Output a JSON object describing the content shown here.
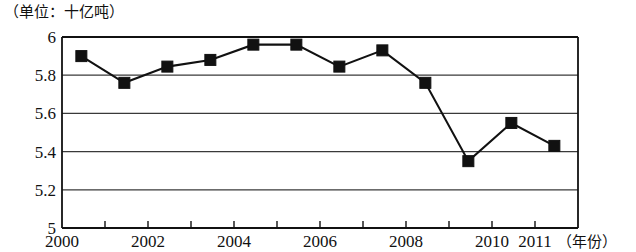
{
  "chart_data": {
    "type": "line",
    "title": "（单位：十亿吨）",
    "unit_label": "（单位：十亿吨）",
    "xlabel": "（年份）",
    "ylabel": "",
    "x": [
      2000,
      2001,
      2002,
      2003,
      2004,
      2005,
      2006,
      2007,
      2008,
      2009,
      2010,
      2011
    ],
    "categories": [
      "2000",
      "2001",
      "2002",
      "2003",
      "2004",
      "2005",
      "2006",
      "2007",
      "2008",
      "2009",
      "2010",
      "2011"
    ],
    "values": [
      5.9,
      5.76,
      5.845,
      5.88,
      5.96,
      5.96,
      5.845,
      5.93,
      5.76,
      5.35,
      5.55,
      5.43
    ],
    "series": [
      {
        "name": "",
        "values": [
          5.9,
          5.76,
          5.845,
          5.88,
          5.96,
          5.96,
          5.845,
          5.93,
          5.76,
          5.35,
          5.55,
          5.43
        ]
      }
    ],
    "ylim": [
      5,
      6
    ],
    "xlim": [
      2000,
      2012
    ],
    "y_ticks": [
      5,
      5.2,
      5.4,
      5.6,
      5.8,
      6
    ],
    "y_tick_labels": [
      "5",
      "5.2",
      "5.4",
      "5.6",
      "5.8",
      "6"
    ],
    "x_ticks": [
      2000,
      2001,
      2002,
      2003,
      2004,
      2005,
      2006,
      2007,
      2008,
      2009,
      2010,
      2011,
      2012
    ],
    "x_tick_labels": [
      "2000",
      "",
      "2002",
      "",
      "2004",
      "",
      "2006",
      "",
      "2008",
      "",
      "2010",
      "2011",
      ""
    ],
    "x_labeled_ticks": [
      {
        "value": 2000,
        "label": "2000"
      },
      {
        "value": 2002,
        "label": "2002"
      },
      {
        "value": 2004,
        "label": "2004"
      },
      {
        "value": 2006,
        "label": "2006"
      },
      {
        "value": 2008,
        "label": "2008"
      },
      {
        "value": 2010,
        "label": "2010"
      },
      {
        "value": 2011,
        "label": "2011"
      }
    ],
    "grid": true,
    "grid_axis": "y",
    "legend": false,
    "legend_position": "none",
    "marker": "square",
    "line_color": "#111111",
    "marker_color": "#111111",
    "grid_color": "#3a3a3a",
    "background": "#ffffff"
  }
}
